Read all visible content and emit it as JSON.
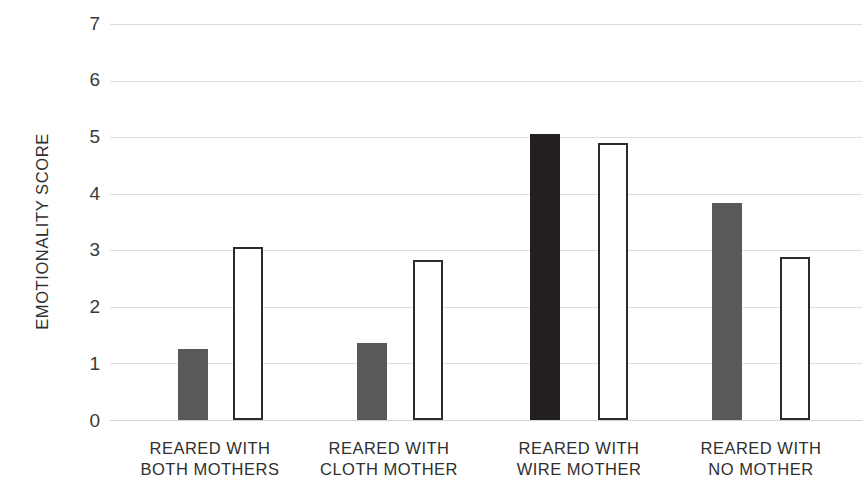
{
  "chart_data": {
    "type": "bar",
    "title": "",
    "xlabel": "",
    "ylabel": "EMOTIONALITY SCORE",
    "ylim": [
      0,
      7
    ],
    "ytick_labels": [
      "0",
      "1",
      "2",
      "3",
      "4",
      "5",
      "6",
      "7"
    ],
    "ytick_values": [
      0,
      1,
      2,
      3,
      4,
      5,
      6,
      7
    ],
    "grid": true,
    "legend": "none",
    "categories": [
      "REARED WITH BOTH MOTHERS",
      "REARED WITH CLOTH MOTHER",
      "REARED WITH WIRE MOTHER",
      "REARED WITH NO MOTHER"
    ],
    "category_lines": [
      [
        "REARED WITH",
        "BOTH MOTHERS"
      ],
      [
        "REARED WITH",
        "CLOTH MOTHER"
      ],
      [
        "REARED WITH",
        "WIRE MOTHER"
      ],
      [
        "REARED WITH",
        "NO MOTHER"
      ]
    ],
    "series": [
      {
        "name": "filled",
        "style": "solid-fill",
        "values": [
          1.25,
          1.37,
          5.05,
          3.83
        ],
        "colors": [
          "#59595b",
          "#59595b",
          "#231f20",
          "#59595b"
        ]
      },
      {
        "name": "outlined",
        "style": "white-fill-dark-outline",
        "values": [
          3.05,
          2.82,
          4.9,
          2.88
        ],
        "colors": [
          "#ffffff",
          "#ffffff",
          "#ffffff",
          "#ffffff"
        ]
      }
    ]
  },
  "colors": {
    "gray_fill": "#59595b",
    "black_fill": "#231f20",
    "outline": "#2b2b2b",
    "gridline": "#dededd",
    "background": "#ffffff",
    "text": "#2f2f2f"
  },
  "axis": {
    "y_title": "EMOTIONALITY SCORE",
    "y_ticks": [
      "7",
      "6",
      "5",
      "4",
      "3",
      "2",
      "1",
      "0"
    ]
  }
}
